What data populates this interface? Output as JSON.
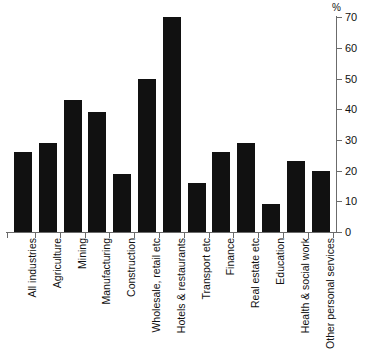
{
  "chart_data": {
    "type": "bar",
    "title": "",
    "subtitle": "",
    "xlabel": "",
    "ylabel": "%",
    "ylim": [
      0,
      70
    ],
    "ytick_values": [
      0,
      10,
      20,
      30,
      40,
      50,
      60,
      70
    ],
    "ytick_labels": [
      "0",
      "10",
      "20",
      "30",
      "40",
      "50",
      "60",
      "70"
    ],
    "grid": false,
    "legend": false,
    "legend_position": "none",
    "axis_side": "right",
    "bar_color": "#111111",
    "categories": [
      "All industries",
      "Agriculture",
      "Mining",
      "Manufacturing",
      "Construction",
      "Wholesale, retail etc",
      "Hotels & restaurants",
      "Transport etc",
      "Finance",
      "Real estate etc",
      "Education",
      "Health & social work",
      "Other personal services"
    ],
    "values": [
      26,
      29,
      43,
      39,
      19,
      50,
      70,
      16,
      26,
      29,
      9,
      23,
      20
    ]
  },
  "axis": {
    "percent_symbol": "%"
  }
}
